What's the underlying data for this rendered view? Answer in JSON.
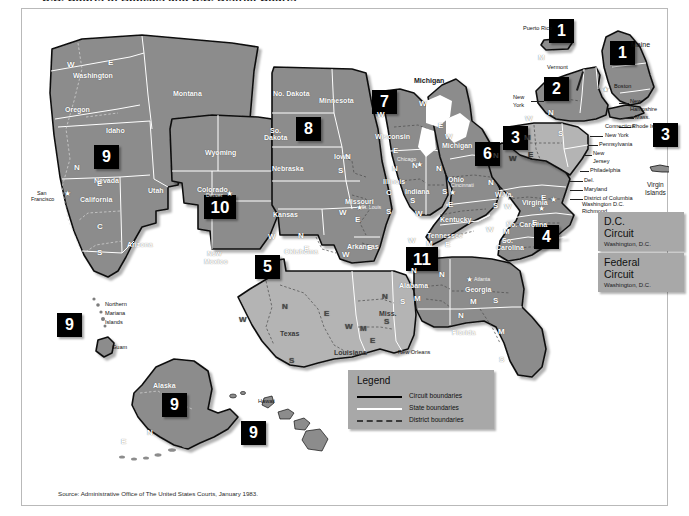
{
  "page": {
    "top_fragment": "U.S. Courts of Appeals and U.S. District Courts",
    "source_note": "Source: Administrative Office of The United States Courts, January 1983."
  },
  "legend": {
    "title": "Legend",
    "rows": [
      {
        "label": "Circuit boundaries",
        "style": "solid-black"
      },
      {
        "label": "State boundaries",
        "style": "solid-white"
      },
      {
        "label": "District boundaries",
        "style": "dashed"
      }
    ]
  },
  "info_panels": [
    {
      "title_line1": "D.C.",
      "title_line2": "Circuit",
      "subtitle": "Washington, D.C."
    },
    {
      "title_line1": "Federal",
      "title_line2": "Circuit",
      "subtitle": "Washington, D.C."
    }
  ],
  "circuit_badges": [
    {
      "number": "1",
      "place": "Puerto Rico",
      "x": 548,
      "y": 22
    },
    {
      "number": "1",
      "place": "Maine / New England",
      "x": 609,
      "y": 44
    },
    {
      "number": "2",
      "place": "New York",
      "x": 543,
      "y": 80
    },
    {
      "number": "3",
      "place": "Pennsylvania / New Jersey",
      "x": 502,
      "y": 129
    },
    {
      "number": "3",
      "place": "Virgin Islands",
      "x": 652,
      "y": 126
    },
    {
      "number": "4",
      "place": "Carolinas",
      "x": 533,
      "y": 228
    },
    {
      "number": "5",
      "place": "Texas / Louisiana",
      "x": 254,
      "y": 258
    },
    {
      "number": "6",
      "place": "Ohio / Kentucky",
      "x": 474,
      "y": 145
    },
    {
      "number": "7",
      "place": "Illinois / Wisconsin",
      "x": 371,
      "y": 93
    },
    {
      "number": "8",
      "place": "Plains states",
      "x": 295,
      "y": 120
    },
    {
      "number": "9",
      "place": "West",
      "x": 93,
      "y": 148
    },
    {
      "number": "9",
      "place": "Northern Mariana Islands / Guam",
      "x": 56,
      "y": 316
    },
    {
      "number": "9",
      "place": "Alaska",
      "x": 161,
      "y": 396
    },
    {
      "number": "9",
      "place": "Hawaii",
      "x": 240,
      "y": 424
    },
    {
      "number": "10",
      "place": "Colorado / Mountain",
      "x": 205,
      "y": 198
    },
    {
      "number": "11",
      "place": "Alabama / Georgia / Florida",
      "x": 407,
      "y": 250
    }
  ],
  "state_labels": [
    {
      "text": "Washington",
      "x": 72,
      "y": 67
    },
    {
      "text": "Oregon",
      "x": 64,
      "y": 101
    },
    {
      "text": "Idaho",
      "x": 105,
      "y": 122
    },
    {
      "text": "Montana",
      "x": 172,
      "y": 85
    },
    {
      "text": "Nevada",
      "x": 93,
      "y": 172
    },
    {
      "text": "California",
      "x": 79,
      "y": 191
    },
    {
      "text": "Utah",
      "x": 147,
      "y": 182
    },
    {
      "text": "Arizona",
      "x": 126,
      "y": 236
    },
    {
      "text": "Wyoming",
      "x": 204,
      "y": 144
    },
    {
      "text": "Colorado",
      "x": 196,
      "y": 181
    },
    {
      "text": "New",
      "x": 206,
      "y": 245
    },
    {
      "text": "Mexico",
      "x": 203,
      "y": 253
    },
    {
      "text": "No. Dakota",
      "x": 272,
      "y": 85
    },
    {
      "text": "So.",
      "x": 269,
      "y": 122
    },
    {
      "text": "Dakota",
      "x": 263,
      "y": 129
    },
    {
      "text": "Nebraska",
      "x": 271,
      "y": 160
    },
    {
      "text": "Kansas",
      "x": 272,
      "y": 206
    },
    {
      "text": "Oklahoma",
      "x": 283,
      "y": 243
    },
    {
      "text": "Texas",
      "x": 279,
      "y": 325
    },
    {
      "text": "Minnesota",
      "x": 318,
      "y": 92
    },
    {
      "text": "Iowa",
      "x": 333,
      "y": 148
    },
    {
      "text": "Missouri",
      "x": 344,
      "y": 193
    },
    {
      "text": "Arkansas",
      "x": 346,
      "y": 238
    },
    {
      "text": "Louisiana",
      "x": 333,
      "y": 344
    },
    {
      "text": "Wisconsin",
      "x": 374,
      "y": 128
    },
    {
      "text": "Illinois",
      "x": 382,
      "y": 173
    },
    {
      "text": "Indiana",
      "x": 404,
      "y": 183
    },
    {
      "text": "Michigan",
      "x": 413,
      "y": 72
    },
    {
      "text": "Michigan",
      "x": 441,
      "y": 137
    },
    {
      "text": "Ohio",
      "x": 447,
      "y": 171
    },
    {
      "text": "Kentucky",
      "x": 439,
      "y": 211
    },
    {
      "text": "Tennessee",
      "x": 426,
      "y": 227
    },
    {
      "text": "Miss.",
      "x": 378,
      "y": 305
    },
    {
      "text": "Alabama",
      "x": 398,
      "y": 277
    },
    {
      "text": "Georgia",
      "x": 464,
      "y": 281
    },
    {
      "text": "Florida",
      "x": 451,
      "y": 324
    },
    {
      "text": "W.Va.",
      "x": 493,
      "y": 186
    },
    {
      "text": "Virginia",
      "x": 521,
      "y": 194
    },
    {
      "text": "No. Carolina",
      "x": 506,
      "y": 216
    },
    {
      "text": "So.",
      "x": 501,
      "y": 232
    },
    {
      "text": "Carolina",
      "x": 495,
      "y": 239
    },
    {
      "text": "Alaska",
      "x": 152,
      "y": 377
    }
  ],
  "district_letters": [
    {
      "text": "W",
      "x": 66,
      "y": 56
    },
    {
      "text": "E",
      "x": 107,
      "y": 54
    },
    {
      "text": "N",
      "x": 73,
      "y": 159
    },
    {
      "text": "E",
      "x": 96,
      "y": 175
    },
    {
      "text": "C",
      "x": 96,
      "y": 218
    },
    {
      "text": "S",
      "x": 96,
      "y": 244
    },
    {
      "text": "N",
      "x": 344,
      "y": 148
    },
    {
      "text": "S",
      "x": 337,
      "y": 162
    },
    {
      "text": "W",
      "x": 338,
      "y": 204
    },
    {
      "text": "E",
      "x": 354,
      "y": 211
    },
    {
      "text": "W",
      "x": 267,
      "y": 228
    },
    {
      "text": "N",
      "x": 297,
      "y": 227
    },
    {
      "text": "E",
      "x": 303,
      "y": 240
    },
    {
      "text": "W",
      "x": 238,
      "y": 311
    },
    {
      "text": "N",
      "x": 281,
      "y": 298
    },
    {
      "text": "E",
      "x": 323,
      "y": 305
    },
    {
      "text": "S",
      "x": 288,
      "y": 352
    },
    {
      "text": "W",
      "x": 344,
      "y": 318
    },
    {
      "text": "M",
      "x": 359,
      "y": 320
    },
    {
      "text": "E",
      "x": 369,
      "y": 332
    },
    {
      "text": "N",
      "x": 381,
      "y": 288
    },
    {
      "text": "S",
      "x": 383,
      "y": 313
    },
    {
      "text": "W",
      "x": 341,
      "y": 246
    },
    {
      "text": "E",
      "x": 366,
      "y": 239
    },
    {
      "text": "W",
      "x": 376,
      "y": 106
    },
    {
      "text": "E",
      "x": 392,
      "y": 142
    },
    {
      "text": "N",
      "x": 391,
      "y": 160
    },
    {
      "text": "C",
      "x": 385,
      "y": 184
    },
    {
      "text": "S",
      "x": 385,
      "y": 203
    },
    {
      "text": "N",
      "x": 411,
      "y": 157
    },
    {
      "text": "S",
      "x": 409,
      "y": 192
    },
    {
      "text": "W",
      "x": 414,
      "y": 205
    },
    {
      "text": "W",
      "x": 407,
      "y": 232
    },
    {
      "text": "M",
      "x": 425,
      "y": 235
    },
    {
      "text": "E",
      "x": 444,
      "y": 236
    },
    {
      "text": "W",
      "x": 418,
      "y": 95
    },
    {
      "text": "E",
      "x": 437,
      "y": 117
    },
    {
      "text": "W",
      "x": 444,
      "y": 128
    },
    {
      "text": "N",
      "x": 435,
      "y": 160
    },
    {
      "text": "S",
      "x": 441,
      "y": 183
    },
    {
      "text": "E",
      "x": 447,
      "y": 196
    },
    {
      "text": "N",
      "x": 410,
      "y": 262
    },
    {
      "text": "M",
      "x": 413,
      "y": 290
    },
    {
      "text": "S",
      "x": 399,
      "y": 293
    },
    {
      "text": "N",
      "x": 438,
      "y": 266
    },
    {
      "text": "M",
      "x": 469,
      "y": 293
    },
    {
      "text": "S",
      "x": 492,
      "y": 292
    },
    {
      "text": "N",
      "x": 457,
      "y": 307
    },
    {
      "text": "M",
      "x": 497,
      "y": 323
    },
    {
      "text": "S",
      "x": 498,
      "y": 351
    },
    {
      "text": "N",
      "x": 487,
      "y": 174
    },
    {
      "text": "S",
      "x": 492,
      "y": 197
    },
    {
      "text": "W",
      "x": 503,
      "y": 198
    },
    {
      "text": "E",
      "x": 540,
      "y": 189
    },
    {
      "text": "W",
      "x": 485,
      "y": 221
    },
    {
      "text": "M",
      "x": 502,
      "y": 223
    },
    {
      "text": "E",
      "x": 531,
      "y": 214
    },
    {
      "text": "N",
      "x": 492,
      "y": 147
    },
    {
      "text": "M",
      "x": 523,
      "y": 129
    },
    {
      "text": "W",
      "x": 508,
      "y": 150
    },
    {
      "text": "E",
      "x": 527,
      "y": 146
    },
    {
      "text": "N",
      "x": 547,
      "y": 104
    },
    {
      "text": "W",
      "x": 524,
      "y": 110
    },
    {
      "text": "S",
      "x": 557,
      "y": 125
    },
    {
      "text": "M",
      "x": 537,
      "y": 49
    },
    {
      "text": "E",
      "x": 120,
      "y": 433
    },
    {
      "text": "N",
      "x": 146,
      "y": 424
    }
  ],
  "city_labels": [
    {
      "text": "San",
      "x": 36,
      "y": 186
    },
    {
      "text": "Francisco",
      "x": 30,
      "y": 192
    },
    {
      "text": "Denver",
      "x": 205,
      "y": 188
    },
    {
      "text": "St. Louis",
      "x": 360,
      "y": 200
    },
    {
      "text": "Chicago",
      "x": 396,
      "y": 152
    },
    {
      "text": "Cincinnati",
      "x": 450,
      "y": 178
    },
    {
      "text": "Atlanta",
      "x": 472,
      "y": 272
    },
    {
      "text": "New Orleans",
      "x": 398,
      "y": 345
    },
    {
      "text": "Boston",
      "x": 613,
      "y": 79
    },
    {
      "text": "New York",
      "x": 596,
      "y": 131
    },
    {
      "text": "Philadelphia",
      "x": 587,
      "y": 160
    },
    {
      "text": "Washington D.C.",
      "x": 581,
      "y": 197
    },
    {
      "text": "Richmond",
      "x": 581,
      "y": 204
    }
  ],
  "callout_labels": [
    {
      "text": "Puerto Rico",
      "x": 524,
      "y": 21
    },
    {
      "text": "Maine",
      "x": 630,
      "y": 36
    },
    {
      "text": "Vermont",
      "x": 546,
      "y": 60
    },
    {
      "text": "New",
      "x": 509,
      "y": 89
    },
    {
      "text": "York",
      "x": 510,
      "y": 97
    },
    {
      "text": "New",
      "x": 621,
      "y": 94
    },
    {
      "text": "Hampshire",
      "x": 621,
      "y": 102
    },
    {
      "text": "Mass.",
      "x": 627,
      "y": 110
    },
    {
      "text": "Rhode Is.",
      "x": 624,
      "y": 119
    },
    {
      "text": "Connecticut",
      "x": 601,
      "y": 119
    },
    {
      "text": "New York",
      "x": 601,
      "y": 128
    },
    {
      "text": "Pennsylvania",
      "x": 597,
      "y": 137
    },
    {
      "text": "New",
      "x": 589,
      "y": 146
    },
    {
      "text": "Jersey",
      "x": 589,
      "y": 154
    },
    {
      "text": "Philadelphia",
      "x": 586,
      "y": 163
    },
    {
      "text": "Del.",
      "x": 580,
      "y": 173
    },
    {
      "text": "Maryland",
      "x": 580,
      "y": 182
    },
    {
      "text": "District of Columbia",
      "x": 580,
      "y": 191
    },
    {
      "text": "Virgin",
      "x": 641,
      "y": 177
    },
    {
      "text": "Islands",
      "x": 640,
      "y": 185
    },
    {
      "text": "Northern",
      "x": 86,
      "y": 297
    },
    {
      "text": "Mariana",
      "x": 86,
      "y": 306
    },
    {
      "text": "Islands",
      "x": 86,
      "y": 315
    },
    {
      "text": "Guam",
      "x": 93,
      "y": 340
    },
    {
      "text": "Hawaii",
      "x": 256,
      "y": 394
    }
  ],
  "colors": {
    "circuit_fill_dark": "#8c8c8c",
    "circuit_fill_mid": "#9b9b9b",
    "circuit_fill_light": "#b4b4b4",
    "badge_bg": "#000000",
    "badge_text": "#ffffff",
    "panel_bg": "#a8a8a8",
    "frame_border": "#b9b9b9",
    "page_bg": "#ffffff"
  }
}
